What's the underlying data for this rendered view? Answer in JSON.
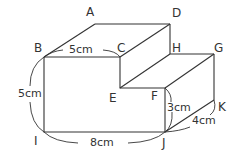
{
  "diagram": {
    "type": "3d-solid-step-shape",
    "vertices": {
      "A": {
        "label": "A"
      },
      "B": {
        "label": "B"
      },
      "C": {
        "label": "C"
      },
      "D": {
        "label": "D"
      },
      "E": {
        "label": "E"
      },
      "F": {
        "label": "F"
      },
      "G": {
        "label": "G"
      },
      "H": {
        "label": "H"
      },
      "I": {
        "label": "I"
      },
      "J": {
        "label": "J"
      },
      "K": {
        "label": "K"
      }
    },
    "dimensions": {
      "BC": "5cm",
      "BI": "5cm",
      "IJ": "8cm",
      "FJ": "3cm",
      "JK": "4cm"
    },
    "line_color": "#333333"
  }
}
